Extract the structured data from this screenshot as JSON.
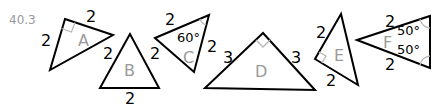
{
  "problem_number": "40.3",
  "triangles": [
    {
      "name": "A",
      "vertices": [
        [
          65,
          19
        ],
        [
          113,
          35
        ],
        [
          50,
          70
        ]
      ],
      "right_angle_at": [
        65,
        19
      ],
      "side_labels": [
        {
          "text": "2",
          "x": 86,
          "y": 22
        },
        {
          "text": "2",
          "x": 41,
          "y": 46
        }
      ]
    },
    {
      "name": "B",
      "vertices": [
        [
          130,
          34
        ],
        [
          100,
          88
        ],
        [
          159,
          88
        ]
      ],
      "side_labels": [
        {
          "text": "2",
          "x": 103,
          "y": 59
        },
        {
          "text": "2",
          "x": 150,
          "y": 59
        },
        {
          "text": "2",
          "x": 125,
          "y": 104
        }
      ]
    },
    {
      "name": "C",
      "vertices": [
        [
          155,
          38
        ],
        [
          209,
          15
        ],
        [
          194,
          72
        ]
      ],
      "angle_labels": [
        {
          "text": "60°",
          "at": [
            209,
            15
          ],
          "x": 177,
          "y": 42
        }
      ],
      "side_labels": [
        {
          "text": "2",
          "x": 165,
          "y": 25
        },
        {
          "text": "2",
          "x": 207,
          "y": 52
        }
      ]
    },
    {
      "name": "D",
      "vertices": [
        [
          263,
          33
        ],
        [
          205,
          88
        ],
        [
          315,
          90
        ]
      ],
      "right_angle_at": [
        263,
        33
      ],
      "side_labels": [
        {
          "text": "3",
          "x": 223,
          "y": 63
        },
        {
          "text": "3",
          "x": 291,
          "y": 63
        }
      ]
    },
    {
      "name": "E",
      "vertices": [
        [
          341,
          14
        ],
        [
          315,
          59
        ],
        [
          358,
          85
        ]
      ],
      "right_angle_at": [
        315,
        59
      ],
      "side_labels": [
        {
          "text": "2",
          "x": 316,
          "y": 38
        },
        {
          "text": "2",
          "x": 326,
          "y": 86
        }
      ]
    },
    {
      "name": "F",
      "vertices": [
        [
          357,
          40
        ],
        [
          430,
          16
        ],
        [
          430,
          68
        ]
      ],
      "angle_labels": [
        {
          "text": "50°",
          "at": [
            430,
            16
          ],
          "x": 397,
          "y": 35
        },
        {
          "text": "50°",
          "at": [
            430,
            68
          ],
          "x": 397,
          "y": 54
        }
      ],
      "side_labels": [
        {
          "text": "2",
          "x": 385,
          "y": 27
        },
        {
          "text": "2",
          "x": 385,
          "y": 70
        }
      ]
    }
  ],
  "labels": {
    "A": "A",
    "B": "B",
    "C": "C",
    "D": "D",
    "E": "E",
    "F": "F"
  }
}
